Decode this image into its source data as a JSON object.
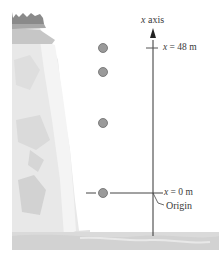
{
  "diagram": {
    "axis_label_var": "x",
    "axis_label_text": " axis",
    "top_marker": {
      "var": "x",
      "text": " = 48 m"
    },
    "bottom_marker": {
      "var": "x",
      "text": " = 0 m"
    },
    "origin_label": "Origin",
    "ball_positions_px": [
      48,
      72,
      123,
      193
    ],
    "colors": {
      "cliff_dark": "#8a8a8a",
      "cliff_mid": "#c4c4c4",
      "cliff_light": "#e2e2e2",
      "cliff_lightest": "#efefef",
      "ball_fill": "#9a9a9a",
      "ball_stroke": "#6a6a6a",
      "axis": "#333333",
      "ground": "#d9d9d9"
    }
  }
}
